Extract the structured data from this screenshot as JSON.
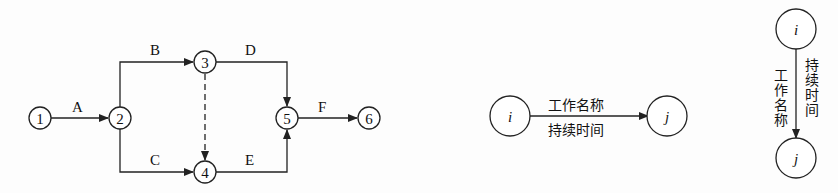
{
  "network": {
    "nodes": [
      {
        "id": "1",
        "label": "1",
        "x": 40,
        "y": 118
      },
      {
        "id": "2",
        "label": "2",
        "x": 120,
        "y": 118
      },
      {
        "id": "3",
        "label": "3",
        "x": 205,
        "y": 62
      },
      {
        "id": "4",
        "label": "4",
        "x": 205,
        "y": 172
      },
      {
        "id": "5",
        "label": "5",
        "x": 287,
        "y": 118
      },
      {
        "id": "6",
        "label": "6",
        "x": 369,
        "y": 118
      }
    ],
    "activities": [
      {
        "name": "A",
        "from": "1",
        "to": "2",
        "dummy": false
      },
      {
        "name": "B",
        "from": "2",
        "to": "3",
        "dummy": false
      },
      {
        "name": "C",
        "from": "2",
        "to": "4",
        "dummy": false
      },
      {
        "name": "D",
        "from": "3",
        "to": "5",
        "dummy": false
      },
      {
        "name": "E",
        "from": "4",
        "to": "5",
        "dummy": false
      },
      {
        "name": "F",
        "from": "5",
        "to": "6",
        "dummy": false
      },
      {
        "name": "",
        "from": "3",
        "to": "4",
        "dummy": true
      }
    ]
  },
  "legend_horizontal": {
    "start_node": "i",
    "end_node": "j",
    "top_text": "工作名称",
    "bottom_text": "持续时间"
  },
  "legend_vertical": {
    "start_node": "i",
    "end_node": "j",
    "left_text": "工作名称",
    "right_text": "持续时间"
  }
}
